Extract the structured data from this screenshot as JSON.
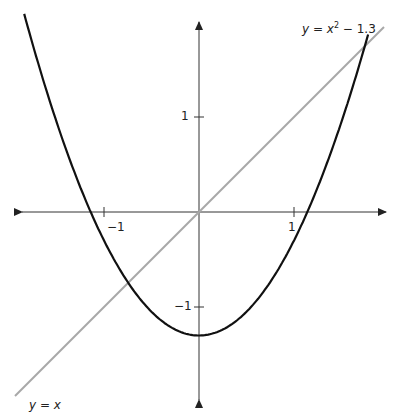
{
  "diagram": {
    "origin_px": [
      199,
      212
    ],
    "unit_px": 95,
    "x_range": [
      -1.85,
      1.92
    ],
    "y_range": [
      -2.0,
      2.0
    ],
    "axes": {
      "x_ticks": [
        {
          "value": -1,
          "label": "−1"
        },
        {
          "value": 1,
          "label": "1"
        }
      ],
      "y_ticks": [
        {
          "value": 1,
          "label": "1"
        },
        {
          "value": -1,
          "label": "−1"
        }
      ]
    },
    "curves": [
      {
        "name": "parabola",
        "equation_label": {
          "lhs": "y",
          "eq": " = ",
          "base": "x",
          "exp": "2",
          "rest": " − 1.3"
        },
        "color": "#111111"
      },
      {
        "name": "line",
        "equation_label": {
          "lhs": "y",
          "eq": " = ",
          "rhs": "x"
        },
        "color": "#a8a8a8"
      }
    ],
    "colors": {
      "axis": "#333333",
      "parabola": "#111111",
      "line": "#a8a8a8"
    }
  }
}
